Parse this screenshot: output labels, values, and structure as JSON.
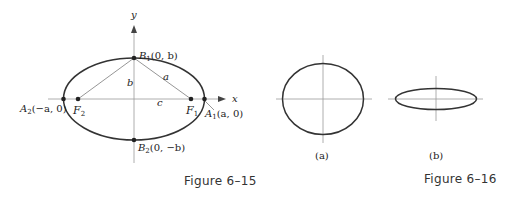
{
  "figures": [
    {
      "id": "fig-6-15",
      "caption": "Figure 6–15",
      "axes": {
        "x_label": "x",
        "y_label": "y"
      },
      "labels": {
        "B1": "B₁(0, b)",
        "B1_main": "B",
        "B1_sub": "1",
        "B1_coords": "(0, b)",
        "B2_main": "B",
        "B2_sub": "2",
        "B2_coords": "(0, −b)",
        "A1_main": "A",
        "A1_sub": "1",
        "A1_coords": "(a, 0)",
        "A2_main": "A",
        "A2_sub": "2",
        "A2_coords": "(−a, 0)",
        "F1_main": "F",
        "F1_sub": "1",
        "F2_main": "F",
        "F2_sub": "2",
        "seg_a": "a",
        "seg_b": "b",
        "seg_c": "c"
      }
    },
    {
      "id": "fig-6-16",
      "caption": "Figure 6–16",
      "panels": [
        {
          "label": "(a)",
          "shape": "near-circular ellipse"
        },
        {
          "label": "(b)",
          "shape": "elongated flat ellipse"
        }
      ]
    }
  ]
}
